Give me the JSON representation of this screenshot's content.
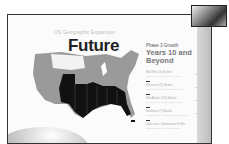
{
  "slide": {
    "subtitle": "US Geographic Expansion",
    "title": "Future",
    "phase": "Phase 3 Growth",
    "years": "Years 10 and Beyond",
    "items": [
      {
        "name": "Mid-West (X) Market",
        "desc": "Expansion into central market region",
        "val": "TBD"
      },
      {
        "name": "Wisconsin (X) Market",
        "desc": "Expansion into northern market region",
        "val": "TBD"
      },
      {
        "name": "Mid-Atlantic (XX) Market",
        "desc": "Expansion into eastern market region",
        "val": "TBD"
      },
      {
        "name": "Southeast (?) Market",
        "desc": "Expansion into southeastern market region",
        "val": "TBD"
      },
      {
        "name": "Sales force Optimization Profile",
        "desc": "Optimize sales force across regions",
        "val": ""
      }
    ],
    "colors": {
      "map_gray": "#999999",
      "map_dark": "#111111",
      "map_light": "#f2f2f2"
    }
  },
  "webcam": {
    "label": "presenter-video"
  }
}
